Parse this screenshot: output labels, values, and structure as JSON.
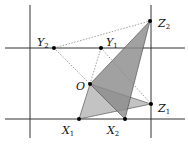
{
  "diagram": {
    "lines": {
      "vertical": [
        {
          "x": 30,
          "y1": 5,
          "y2": 138
        },
        {
          "x": 151,
          "y1": 5,
          "y2": 138
        }
      ],
      "horizontal": [
        {
          "y": 48,
          "x1": 5,
          "x2": 185
        },
        {
          "y": 119,
          "x1": 5,
          "x2": 185
        }
      ]
    },
    "points": [
      {
        "id": "Z2",
        "label": "Z",
        "sub": "2",
        "x": 150,
        "y": 21,
        "lx": 158,
        "ly": 27
      },
      {
        "id": "Y2",
        "label": "Y",
        "sub": "2",
        "x": 54,
        "y": 48,
        "lx": 37,
        "ly": 46
      },
      {
        "id": "Y1",
        "label": "Y",
        "sub": "1",
        "x": 101,
        "y": 48,
        "lx": 106,
        "ly": 46
      },
      {
        "id": "O",
        "label": "O",
        "sub": "",
        "x": 90,
        "y": 84,
        "lx": 76,
        "ly": 90
      },
      {
        "id": "Z1",
        "label": "Z",
        "sub": "1",
        "x": 151,
        "y": 104,
        "lx": 158,
        "ly": 112
      },
      {
        "id": "X1",
        "label": "X",
        "sub": "1",
        "x": 79,
        "y": 119,
        "lx": 62,
        "ly": 134
      },
      {
        "id": "X2",
        "label": "X",
        "sub": "2",
        "x": 125,
        "y": 119,
        "lx": 107,
        "ly": 134
      }
    ],
    "colors": {
      "line": "#333333",
      "dotted": "#888888",
      "shade_light": "#b8b8b8",
      "shade_dark": "#8a8a8a"
    }
  }
}
